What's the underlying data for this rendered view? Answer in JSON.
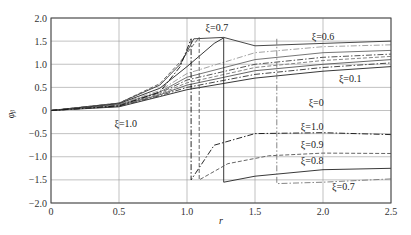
{
  "chart_data": {
    "type": "line",
    "title": "",
    "xlabel": "r",
    "ylabel": "φ_b",
    "xlim": [
      0,
      2.5
    ],
    "ylim": [
      -2.0,
      2.0
    ],
    "grid": true,
    "legend": "inline annotations",
    "x_ticks": [
      "0",
      "0.5",
      "1.0",
      "1.5",
      "2.0",
      "2.5"
    ],
    "y_ticks": [
      "2.0",
      "1.5",
      "1.0",
      "0.5",
      "0",
      "-0.5",
      "-1.0",
      "-1.5",
      "-2.0"
    ],
    "annotations": [
      {
        "text": "ξ=0.7",
        "x": 1.22,
        "y": 1.72
      },
      {
        "text": "ξ=0.6",
        "x": 2.0,
        "y": 1.52
      },
      {
        "text": "ξ=0.1",
        "x": 2.2,
        "y": 0.62
      },
      {
        "text": "ξ=0",
        "x": 1.95,
        "y": 0.1
      },
      {
        "text": "ξ=1.0",
        "x": 0.55,
        "y": -0.35
      },
      {
        "text": "ξ=1.0",
        "x": 1.92,
        "y": -0.42
      },
      {
        "text": "ξ=0.9",
        "x": 1.92,
        "y": -0.8
      },
      {
        "text": "ξ=0.8",
        "x": 1.92,
        "y": -1.15
      },
      {
        "text": "ξ=0.7",
        "x": 2.15,
        "y": -1.72
      }
    ],
    "series": [
      {
        "name": "ξ=0",
        "style": "solid",
        "x": [
          0,
          0.5,
          0.8,
          1.0,
          1.5,
          2.0,
          2.5
        ],
        "y": [
          0,
          0.08,
          0.3,
          0.45,
          0.7,
          0.85,
          0.95
        ]
      },
      {
        "name": "ξ=0.1",
        "style": "dashdot",
        "x": [
          0,
          0.5,
          0.8,
          1.0,
          1.5,
          2.0,
          2.5
        ],
        "y": [
          0,
          0.09,
          0.32,
          0.5,
          0.78,
          0.93,
          1.03
        ]
      },
      {
        "name": "ξ=0.2",
        "style": "solid",
        "x": [
          0,
          0.5,
          0.8,
          1.0,
          1.5,
          2.0,
          2.5
        ],
        "y": [
          0,
          0.1,
          0.34,
          0.55,
          0.86,
          1.0,
          1.1
        ]
      },
      {
        "name": "ξ=0.3",
        "style": "dashed",
        "x": [
          0,
          0.5,
          0.8,
          1.0,
          1.5,
          2.0,
          2.5
        ],
        "y": [
          0,
          0.11,
          0.36,
          0.6,
          0.93,
          1.08,
          1.17
        ]
      },
      {
        "name": "ξ=0.4",
        "style": "dashdot",
        "x": [
          0,
          0.5,
          0.8,
          1.0,
          1.5,
          2.0,
          2.5
        ],
        "y": [
          0,
          0.12,
          0.38,
          0.66,
          1.0,
          1.15,
          1.22
        ]
      },
      {
        "name": "ξ=0.5",
        "style": "solid",
        "x": [
          0,
          0.5,
          0.8,
          1.0,
          1.5,
          2.0,
          2.5
        ],
        "y": [
          0,
          0.13,
          0.4,
          0.72,
          1.1,
          1.25,
          1.3
        ]
      },
      {
        "name": "ξ=0.6",
        "style": "dashdot",
        "x": [
          0,
          0.5,
          0.8,
          1.0,
          1.5,
          2.0,
          2.5
        ],
        "y": [
          0,
          0.14,
          0.43,
          0.8,
          1.25,
          1.38,
          1.42
        ]
      },
      {
        "name": "ξ=0.7",
        "style": "solid",
        "x": [
          0,
          0.5,
          0.8,
          1.0,
          1.2,
          1.27,
          1.27,
          1.5,
          2.0,
          2.5
        ],
        "y": [
          0,
          0.15,
          0.48,
          0.95,
          1.45,
          1.57,
          -1.55,
          -1.42,
          -1.28,
          -1.25
        ]
      },
      {
        "name": "ξ=0.8",
        "style": "solid",
        "x": [
          0,
          0.5,
          0.8,
          0.95,
          1.05,
          1.27,
          1.5,
          2.0,
          2.5
        ],
        "y": [
          0,
          0.16,
          0.55,
          1.0,
          1.55,
          1.58,
          1.4,
          1.45,
          1.5
        ]
      },
      {
        "name": "ξ=0.9",
        "style": "dashed",
        "x": [
          0,
          0.5,
          0.8,
          0.95,
          1.09,
          1.09,
          1.3,
          1.6,
          2.0,
          2.5
        ],
        "y": [
          0,
          0.16,
          0.58,
          1.05,
          1.58,
          -1.5,
          -1.15,
          -0.98,
          -0.92,
          -0.93
        ]
      },
      {
        "name": "ξ=1.0",
        "style": "dashdot",
        "x": [
          0,
          0.5,
          0.8,
          0.95,
          1.03,
          1.03,
          1.2,
          1.5,
          2.0,
          2.5
        ],
        "y": [
          0,
          0.1,
          0.4,
          0.95,
          1.55,
          -1.5,
          -0.75,
          -0.5,
          -0.48,
          -0.52
        ]
      },
      {
        "name": "ξ=0.7 tail",
        "style": "dashdot",
        "x": [
          1.66,
          1.66,
          2.0,
          2.5
        ],
        "y": [
          1.55,
          -1.58,
          -1.55,
          -1.48
        ]
      }
    ]
  }
}
